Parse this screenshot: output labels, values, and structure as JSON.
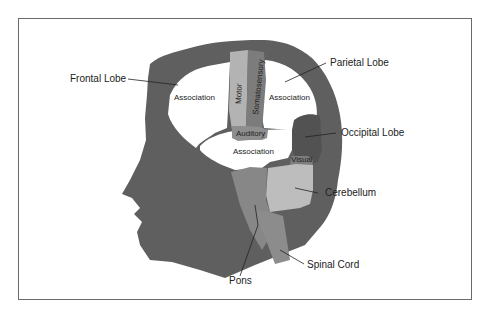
{
  "figure": {
    "colors": {
      "head": "#5f5f5f",
      "association": "#ffffff",
      "motor": "#b3b3b3",
      "somatosensory": "#7c7c7c",
      "auditory": "#8e8e8e",
      "occipital": "#525252",
      "visual": "#7d7d7d",
      "cerebellum": "#bdbdbd",
      "pons": "#878787",
      "spinal_cord": "#8c8c8c",
      "frame": "#6a6a6a"
    },
    "labels": {
      "frontal_lobe": "Frontal Lobe",
      "parietal_lobe": "Parietal Lobe",
      "occipital_lobe": "Occipital Lobe",
      "cerebellum": "Cerebellum",
      "spinal_cord": "Spinal Cord",
      "pons": "Pons"
    },
    "region_text": {
      "frontal_association": "Association",
      "parietal_association": "Association",
      "temporal_association": "Association",
      "motor": "Motor",
      "somatosensory": "Somatosensory",
      "auditory": "Auditory",
      "visual": "Visual"
    }
  }
}
